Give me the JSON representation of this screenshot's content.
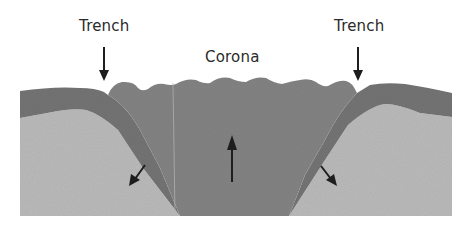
{
  "diagram": {
    "labels": {
      "trench_left": "Trench",
      "corona": "Corona",
      "trench_right": "Trench"
    },
    "layers": [
      {
        "name": "lithosphere",
        "color": "#7b7b7b"
      },
      {
        "name": "upwelling-plume",
        "color": "#858585"
      },
      {
        "name": "mantle",
        "color": "#b9b9b9"
      }
    ],
    "arrows": [
      {
        "name": "trench-left-arrow",
        "direction": "down"
      },
      {
        "name": "trench-right-arrow",
        "direction": "down"
      },
      {
        "name": "upwelling-arrow",
        "direction": "up"
      },
      {
        "name": "subduction-left-arrow",
        "direction": "down-left"
      },
      {
        "name": "subduction-right-arrow",
        "direction": "down-right"
      }
    ],
    "colors": {
      "text": "#2a2a2a",
      "arrow": "#1e1e1e",
      "background": "#ffffff"
    }
  }
}
